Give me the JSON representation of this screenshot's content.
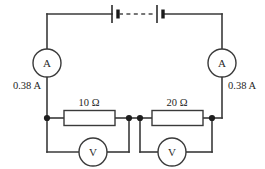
{
  "diagram": {
    "colors": {
      "wire": "#3a3a3a",
      "node": "#1e1e1e",
      "text": "#1e1e1e",
      "background": "#ffffff"
    },
    "battery": {
      "name": "battery",
      "cell_count": 2,
      "separator": "dashed-line"
    },
    "ammeters": [
      {
        "symbol": "A",
        "reading": "0.38 A",
        "position": "left"
      },
      {
        "symbol": "A",
        "reading": "0.38 A",
        "position": "right"
      }
    ],
    "resistors": [
      {
        "label": "10 Ω",
        "value": "10",
        "unit": "Ω",
        "position": "left"
      },
      {
        "label": "20 Ω",
        "value": "20",
        "unit": "Ω",
        "position": "right"
      }
    ],
    "voltmeters": [
      {
        "symbol": "V",
        "position": "left"
      },
      {
        "symbol": "V",
        "position": "right"
      }
    ]
  }
}
